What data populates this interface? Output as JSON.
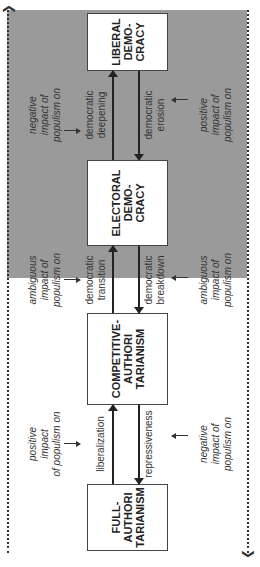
{
  "diagram": {
    "orientation": "rotated 90 degrees counter-clockwise",
    "regimes": [
      {
        "id": "full",
        "label": "FULL-\nAUTHORI\nTARIANISM"
      },
      {
        "id": "competitive",
        "label": "COMPETITIVE-\nAUTHORI\nTARIANISM"
      },
      {
        "id": "electoral",
        "label": "ELECTORAL\nDEMO-\nCRACY"
      },
      {
        "id": "liberal",
        "label": "LIBERAL\nDEMO-\nCRACY"
      }
    ],
    "transitions": {
      "liberalization": "liberalization",
      "repressiveness": "repressiveness",
      "democratic_transition": "democratic\ntransition",
      "democratic_breakdown": "democratic\nbreakdown",
      "democratic_deepening": "democratic\ndeepening",
      "democratic_erosion": "democratic\nerosion"
    },
    "impacts": {
      "liberalization": "positive\nimpact\nof populism on",
      "repressiveness": "negative\nimpact of\npopulism on",
      "democratic_transition": "ambiguous\nimpact of\npopulism on",
      "democratic_breakdown": "ambiguous\nimpact of\npopulism on",
      "democratic_deepening": "negative\nimpact of\npopulism on",
      "democratic_erosion": "positive\nimpact of\npopulism on"
    },
    "colors": {
      "democracy_zone": "#9a9a9a",
      "box_fill": "#ffffff",
      "line": "#222222"
    }
  }
}
